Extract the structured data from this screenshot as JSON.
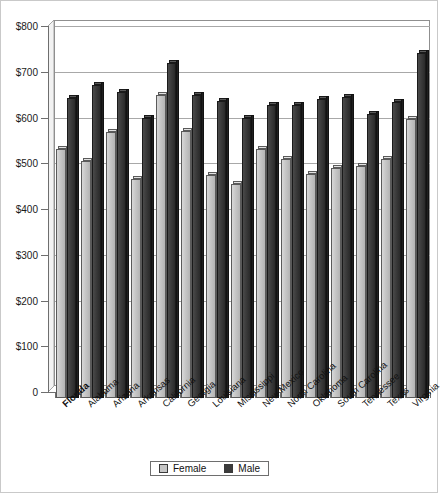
{
  "chart_data": {
    "type": "bar",
    "title": "",
    "subtitle": "",
    "xlabel": "",
    "ylabel": "",
    "ylim": [
      0,
      800
    ],
    "grid": true,
    "legend_position": "bottom",
    "value_prefix": "$",
    "categories": [
      "Florida",
      "Alabama",
      "Arizona",
      "Arkansas",
      "California",
      "Georgia",
      "Louisiana",
      "Mississippi",
      "New Mexico",
      "North Carolina",
      "Oklahoma",
      "South Carolina",
      "Tennessee",
      "Texas",
      "Virginia"
    ],
    "highlight_category": "Florida",
    "series": [
      {
        "name": "Female",
        "color": "#c6c6c6",
        "values": [
          545,
          518,
          582,
          478,
          662,
          583,
          487,
          468,
          545,
          523,
          489,
          503,
          508,
          523,
          610
        ]
      },
      {
        "name": "Male",
        "color": "#3b3b3b",
        "values": [
          655,
          685,
          668,
          613,
          732,
          662,
          650,
          613,
          640,
          640,
          654,
          658,
          620,
          648,
          755
        ]
      }
    ],
    "yticks": [
      {
        "value": 0,
        "label": "0"
      },
      {
        "value": 100,
        "label": "$100"
      },
      {
        "value": 200,
        "label": "$200"
      },
      {
        "value": 300,
        "label": "$300"
      },
      {
        "value": 400,
        "label": "$400"
      },
      {
        "value": 500,
        "label": "$500"
      },
      {
        "value": 600,
        "label": "$600"
      },
      {
        "value": 700,
        "label": "$700"
      },
      {
        "value": 800,
        "label": "$800"
      }
    ]
  },
  "legend": {
    "items": [
      {
        "label": "Female",
        "key": "female"
      },
      {
        "label": "Male",
        "key": "male"
      }
    ]
  }
}
